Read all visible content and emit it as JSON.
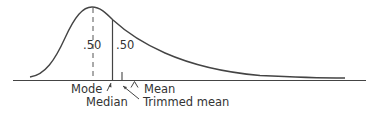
{
  "diagram": {
    "type": "skewed-distribution",
    "area_labels": {
      "left": ".50",
      "right": ".50"
    },
    "markers": {
      "mode": "Mode",
      "median": "Median",
      "trimmed_mean": "Trimmed mean",
      "mean": "Mean"
    },
    "colors": {
      "line": "#444444",
      "text": "#333333"
    }
  }
}
